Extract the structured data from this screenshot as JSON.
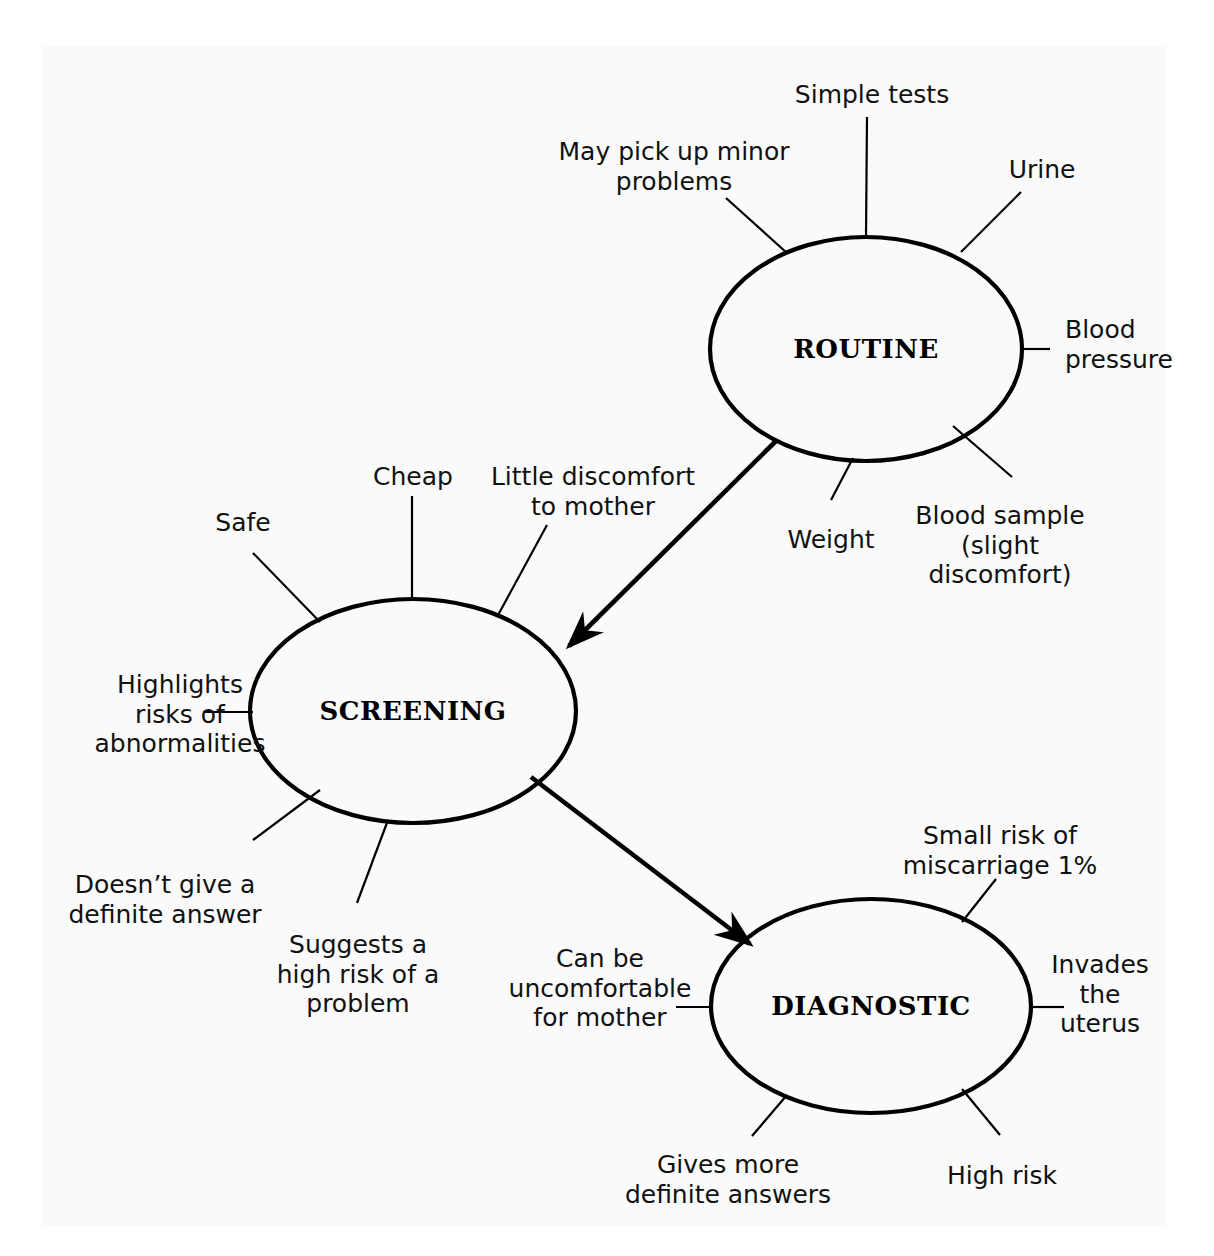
{
  "diagram": {
    "type": "concept-map",
    "title": "",
    "background_color": "#fafafa",
    "line_color": "#000000",
    "nodes": [
      {
        "id": "routine",
        "label": "ROUTINE",
        "cx": 866,
        "cy": 349,
        "rx": 156,
        "ry": 112
      },
      {
        "id": "screening",
        "label": "SCREENING",
        "cx": 413,
        "cy": 711,
        "rx": 163,
        "ry": 112
      },
      {
        "id": "diagnostic",
        "label": "DIAGNOSTIC",
        "cx": 871,
        "cy": 1006,
        "rx": 160,
        "ry": 107
      }
    ],
    "arrows": [
      {
        "id": "routine-to-screening",
        "from": "routine",
        "to": "screening"
      },
      {
        "id": "screening-to-diagnostic",
        "from": "screening",
        "to": "diagnostic"
      }
    ],
    "leaves": {
      "routine": [
        {
          "id": "simple-tests",
          "text": "Simple tests",
          "x": 872,
          "y": 80,
          "align": "center"
        },
        {
          "id": "may-pick-up-minor-problems",
          "text": "May pick up minor\nproblems",
          "x": 674,
          "y": 137,
          "align": "center"
        },
        {
          "id": "urine",
          "text": "Urine",
          "x": 1042,
          "y": 155,
          "align": "center"
        },
        {
          "id": "blood-pressure",
          "text": "Blood\npressure",
          "x": 1065,
          "y": 315,
          "align": "left"
        },
        {
          "id": "blood-sample",
          "text": "Blood sample\n(slight discomfort)",
          "x": 1000,
          "y": 501,
          "align": "center"
        },
        {
          "id": "weight",
          "text": "Weight",
          "x": 831,
          "y": 525,
          "align": "center"
        }
      ],
      "screening": [
        {
          "id": "cheap",
          "text": "Cheap",
          "x": 413,
          "y": 462,
          "align": "center"
        },
        {
          "id": "little-discomfort-to-mother",
          "text": "Little discomfort\nto mother",
          "x": 593,
          "y": 462,
          "align": "center"
        },
        {
          "id": "safe",
          "text": "Safe",
          "x": 243,
          "y": 508,
          "align": "center"
        },
        {
          "id": "highlights-risks",
          "text": "Highlights\nrisks of\nabnormalities",
          "x": 180,
          "y": 670,
          "align": "center"
        },
        {
          "id": "doesnt-give-definite-answer",
          "text": "Doesn’t give a\ndefinite answer",
          "x": 165,
          "y": 870,
          "align": "center"
        },
        {
          "id": "suggests-high-risk",
          "text": "Suggests a\nhigh risk of a\nproblem",
          "x": 358,
          "y": 930,
          "align": "center"
        }
      ],
      "diagnostic": [
        {
          "id": "small-risk-miscarriage",
          "text": "Small risk of\nmiscarriage 1%",
          "x": 1000,
          "y": 821,
          "align": "center"
        },
        {
          "id": "invades-the-uterus",
          "text": "Invades\nthe\nuterus",
          "x": 1100,
          "y": 950,
          "align": "center"
        },
        {
          "id": "can-be-uncomfortable",
          "text": "Can be\nuncomfortable\nfor mother",
          "x": 600,
          "y": 944,
          "align": "center"
        },
        {
          "id": "gives-more-definite-answers",
          "text": "Gives more\ndefinite answers",
          "x": 728,
          "y": 1150,
          "align": "center"
        },
        {
          "id": "high-risk",
          "text": "High risk",
          "x": 1002,
          "y": 1161,
          "align": "center"
        }
      ]
    }
  }
}
